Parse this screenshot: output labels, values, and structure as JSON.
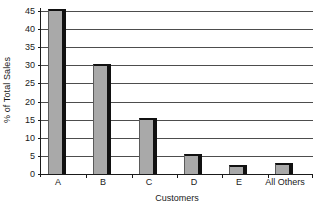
{
  "chart_data": {
    "type": "bar",
    "title": "",
    "subtitle": "",
    "xlabel": "Customers",
    "ylabel": "% of Total Sales",
    "categories": [
      "A",
      "B",
      "C",
      "D",
      "E",
      "All Others"
    ],
    "values": [
      45.5,
      30.5,
      15.5,
      5.5,
      2.5,
      3.0
    ],
    "series": [
      {
        "name": "% of Total Sales",
        "values": [
          45.5,
          30.5,
          15.5,
          5.5,
          2.5,
          3.0
        ]
      }
    ],
    "ylim": [
      0,
      45
    ],
    "ytick_values": [
      0,
      5,
      10,
      15,
      20,
      25,
      30,
      35,
      40,
      45
    ],
    "ytick_labels": [
      "0",
      "5",
      "10",
      "15",
      "20",
      "25",
      "30",
      "35",
      "40",
      "45"
    ],
    "grid": "horizontal",
    "legend": "none",
    "annotations": [],
    "colors": {
      "bar_fill": "#a9a9a9",
      "bar_edge": "#111111",
      "gridline": "#4d4d4d",
      "axis": "#1a1a1a",
      "background": "#ffffff",
      "text": "#1a1a1a"
    }
  }
}
